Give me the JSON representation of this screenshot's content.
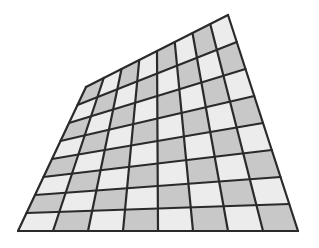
{
  "diagram": {
    "type": "perspective-checkerboard",
    "rows": 8,
    "cols": 8,
    "corners": {
      "top_left": [
        86,
        87
      ],
      "top_right": [
        228,
        15
      ],
      "bottom_right": [
        298,
        231
      ],
      "bottom_left": [
        18,
        231
      ]
    },
    "colors": {
      "dark": "#c8c8c8",
      "light": "#ececec",
      "line": "#2a2a2a",
      "background": "#ffffff"
    },
    "pattern": "dark when (row+col) is even",
    "line_width": 2.2
  }
}
